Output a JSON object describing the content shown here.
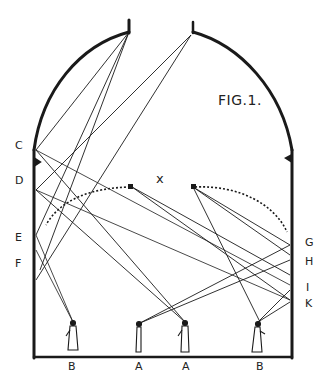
{
  "figure": {
    "title": "FIG.1.",
    "center_mark": "x",
    "wall_labels_left": [
      "C",
      "D",
      "E",
      "F"
    ],
    "wall_labels_right": [
      "G",
      "H",
      "I",
      "K"
    ],
    "floor_labels": [
      "B",
      "A",
      "A",
      "B"
    ],
    "colors": {
      "ink": "#1a1a1a",
      "paper": "#ffffff"
    }
  }
}
